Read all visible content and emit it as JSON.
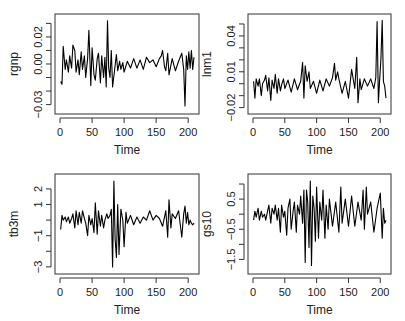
{
  "chart_data": [
    {
      "type": "line",
      "title": "",
      "xlabel": "Time",
      "ylabel": "rgnp",
      "xlim": [
        0,
        209
      ],
      "ylim": [
        -0.034,
        0.034
      ],
      "x_ticks": [
        0,
        50,
        100,
        150,
        200
      ],
      "y_ticks": [
        0.03,
        0.02,
        0.01,
        0.0,
        -0.01,
        -0.02,
        -0.03
      ],
      "y_tick_labels": [
        {
          "v": 0.02,
          "t": "0.02"
        },
        {
          "v": 0.0,
          "t": "0.00"
        },
        {
          "v": -0.03,
          "t": "-0.03"
        }
      ],
      "box": {
        "x0": 55,
        "y0": 14,
        "x1": 199,
        "y1": 114
      },
      "x": [
        1,
        3,
        5,
        8,
        10,
        13,
        15,
        18,
        20,
        23,
        25,
        28,
        30,
        33,
        35,
        38,
        40,
        43,
        45,
        48,
        50,
        53,
        55,
        58,
        60,
        63,
        65,
        68,
        70,
        72,
        74,
        76,
        78,
        80,
        82,
        85,
        88,
        90,
        93,
        95,
        98,
        100,
        105,
        110,
        115,
        120,
        125,
        130,
        135,
        140,
        145,
        150,
        155,
        158,
        160,
        163,
        165,
        168,
        170,
        175,
        180,
        185,
        190,
        193,
        195,
        197,
        199,
        201,
        203,
        205,
        207,
        209
      ],
      "values": [
        -0.013,
        -0.015,
        0.013,
        -0.004,
        0.003,
        -0.006,
        0.006,
        -0.003,
        0.014,
        0.01,
        -0.006,
        0.003,
        -0.008,
        0.009,
        -0.004,
        0.006,
        -0.01,
        0.004,
        0.025,
        -0.016,
        0.012,
        -0.008,
        -0.012,
        0.004,
        0.008,
        -0.014,
        0.006,
        -0.01,
        0.005,
        -0.017,
        0.032,
        -0.003,
        -0.01,
        0.01,
        -0.017,
        -0.005,
        0.007,
        -0.005,
        0.002,
        -0.004,
        0.001,
        -0.006,
        0.002,
        -0.003,
        0.004,
        -0.003,
        0.003,
        -0.004,
        0.005,
        0.001,
        0.003,
        -0.002,
        0.004,
        0.006,
        0.01,
        -0.002,
        -0.005,
        0.008,
        -0.008,
        0.004,
        -0.005,
        0.002,
        0.008,
        -0.004,
        -0.031,
        0.006,
        -0.004,
        0.009,
        -0.003,
        0.01,
        -0.004,
        0.005
      ]
    },
    {
      "type": "line",
      "title": "",
      "xlabel": "Time",
      "ylabel": "lnm1",
      "xlim": [
        0,
        209
      ],
      "ylim": [
        -0.022,
        0.055
      ],
      "x_ticks": [
        0,
        50,
        100,
        150,
        200
      ],
      "y_ticks": [
        0.05,
        0.04,
        0.03,
        0.02,
        0.01,
        0.0,
        -0.01,
        -0.02
      ],
      "y_tick_labels": [
        {
          "v": 0.04,
          "t": "0.04"
        },
        {
          "v": 0.01,
          "t": "0.01"
        },
        {
          "v": -0.02,
          "t": "-0.02"
        }
      ],
      "box": {
        "x0": 248,
        "y0": 14,
        "x1": 391,
        "y1": 114
      },
      "x": [
        1,
        3,
        5,
        8,
        10,
        13,
        15,
        18,
        20,
        23,
        25,
        28,
        30,
        33,
        35,
        38,
        40,
        43,
        45,
        48,
        50,
        55,
        60,
        65,
        70,
        75,
        78,
        80,
        82,
        85,
        88,
        90,
        95,
        100,
        105,
        110,
        115,
        120,
        125,
        128,
        130,
        133,
        135,
        140,
        145,
        150,
        155,
        160,
        163,
        165,
        168,
        170,
        175,
        180,
        185,
        190,
        193,
        195,
        197,
        199,
        201,
        203,
        205,
        207,
        209
      ],
      "values": [
        0.002,
        -0.012,
        0.004,
        -0.002,
        0.004,
        -0.01,
        0.0,
        0.003,
        0.007,
        -0.006,
        0.005,
        -0.014,
        0.003,
        -0.004,
        0.008,
        -0.008,
        0.004,
        -0.006,
        -0.001,
        0.004,
        -0.004,
        0.003,
        -0.007,
        0.004,
        -0.005,
        0.002,
        0.018,
        -0.012,
        0.015,
        0.002,
        0.01,
        -0.004,
        0.002,
        -0.008,
        0.003,
        -0.006,
        0.004,
        -0.002,
        0.005,
        0.017,
        0.003,
        0.01,
        0.004,
        -0.008,
        0.002,
        -0.012,
        0.012,
        -0.004,
        0.022,
        -0.016,
        0.004,
        -0.005,
        0.004,
        -0.002,
        0.004,
        -0.004,
        0.005,
        0.052,
        -0.016,
        0.003,
        0.02,
        0.053,
        0.002,
        -0.002,
        -0.012
      ]
    },
    {
      "type": "line",
      "title": "",
      "xlabel": "Time",
      "ylabel": "tb3m",
      "xlim": [
        0,
        209
      ],
      "ylim": [
        -3.2,
        2.7
      ],
      "x_ticks": [
        0,
        50,
        100,
        150,
        200
      ],
      "y_ticks": [
        2,
        1,
        0,
        -1,
        -2,
        -3
      ],
      "y_tick_labels": [
        {
          "v": 2,
          "t": "2"
        },
        {
          "v": 1,
          "t": "1"
        },
        {
          "v": -1,
          "t": "-1"
        },
        {
          "v": -3,
          "t": "-3"
        }
      ],
      "box": {
        "x0": 55,
        "y0": 174,
        "x1": 199,
        "y1": 274
      },
      "x": [
        1,
        3,
        5,
        8,
        10,
        13,
        15,
        18,
        20,
        23,
        25,
        28,
        30,
        33,
        35,
        38,
        40,
        43,
        45,
        48,
        50,
        53,
        55,
        58,
        60,
        63,
        65,
        68,
        70,
        73,
        75,
        78,
        80,
        82,
        84,
        86,
        88,
        90,
        92,
        95,
        98,
        100,
        103,
        105,
        110,
        115,
        120,
        125,
        130,
        135,
        140,
        145,
        150,
        155,
        160,
        165,
        168,
        170,
        173,
        175,
        180,
        185,
        190,
        193,
        195,
        197,
        199,
        201,
        203,
        205,
        207,
        209
      ],
      "values": [
        -0.6,
        0.3,
        0.0,
        0.2,
        -0.1,
        0.2,
        -0.2,
        0.1,
        0.4,
        -0.5,
        0.6,
        -0.3,
        0.5,
        -0.2,
        0.6,
        0.1,
        -0.2,
        -1.0,
        0.3,
        -0.3,
        0.1,
        -0.8,
        1.1,
        -0.9,
        0.6,
        -0.4,
        0.3,
        -0.5,
        0.0,
        0.4,
        0.1,
        0.3,
        0.7,
        -3.0,
        2.5,
        -1.2,
        -2.4,
        1.0,
        -2.2,
        0.7,
        0.0,
        -1.7,
        0.5,
        -0.2,
        0.3,
        -0.3,
        0.2,
        -0.2,
        0.2,
        0.0,
        0.6,
        0.0,
        0.3,
        0.1,
        -0.4,
        0.6,
        -1.1,
        1.3,
        -0.5,
        0.4,
        0.1,
        0.6,
        -1.1,
        0.4,
        0.9,
        -0.2,
        0.5,
        -0.3,
        0.0,
        -0.2,
        -0.3,
        -0.2
      ]
    },
    {
      "type": "line",
      "title": "",
      "xlabel": "Time",
      "ylabel": "gs10",
      "xlim": [
        0,
        209
      ],
      "ylim": [
        -1.85,
        1.2
      ],
      "x_ticks": [
        0,
        50,
        100,
        150,
        200
      ],
      "y_ticks": [
        1.0,
        0.5,
        0.0,
        -0.5,
        -1.0,
        -1.5
      ],
      "y_tick_labels": [
        {
          "v": 0.5,
          "t": "0.5"
        },
        {
          "v": -0.5,
          "t": "-0.5"
        },
        {
          "v": -1.5,
          "t": "-1.5"
        }
      ],
      "box": {
        "x0": 248,
        "y0": 174,
        "x1": 391,
        "y1": 274
      },
      "x": [
        1,
        3,
        5,
        8,
        10,
        13,
        15,
        18,
        20,
        23,
        25,
        28,
        30,
        33,
        35,
        38,
        40,
        43,
        45,
        48,
        50,
        53,
        55,
        58,
        60,
        63,
        65,
        68,
        70,
        73,
        75,
        78,
        80,
        82,
        84,
        86,
        88,
        90,
        92,
        94,
        96,
        98,
        100,
        103,
        105,
        108,
        110,
        113,
        115,
        118,
        120,
        125,
        130,
        135,
        138,
        140,
        145,
        150,
        155,
        160,
        165,
        170,
        173,
        175,
        178,
        180,
        185,
        190,
        195,
        200,
        203,
        205,
        207,
        209
      ],
      "values": [
        -0.2,
        0.1,
        -0.1,
        0.2,
        -0.2,
        0.1,
        -0.1,
        0.0,
        -0.2,
        0.1,
        0.3,
        -0.3,
        0.2,
        0.0,
        0.3,
        -0.2,
        0.2,
        -0.6,
        0.3,
        -0.1,
        0.1,
        -0.7,
        0.2,
        0.5,
        -0.5,
        0.1,
        0.4,
        -0.6,
        0.3,
        0.0,
        0.6,
        -0.3,
        0.8,
        -1.6,
        0.8,
        0.4,
        -1.1,
        1.1,
        -1.7,
        0.6,
        0.2,
        -0.9,
        0.9,
        -0.8,
        0.4,
        -0.2,
        0.8,
        -0.8,
        0.3,
        -0.5,
        0.5,
        -0.4,
        0.4,
        -0.6,
        0.9,
        -0.3,
        0.5,
        -0.4,
        0.6,
        -0.4,
        0.4,
        -0.2,
        0.8,
        -0.5,
        0.9,
        0.0,
        0.4,
        -0.6,
        0.2,
        0.7,
        -0.8,
        0.2,
        -0.3,
        -0.2
      ]
    }
  ]
}
